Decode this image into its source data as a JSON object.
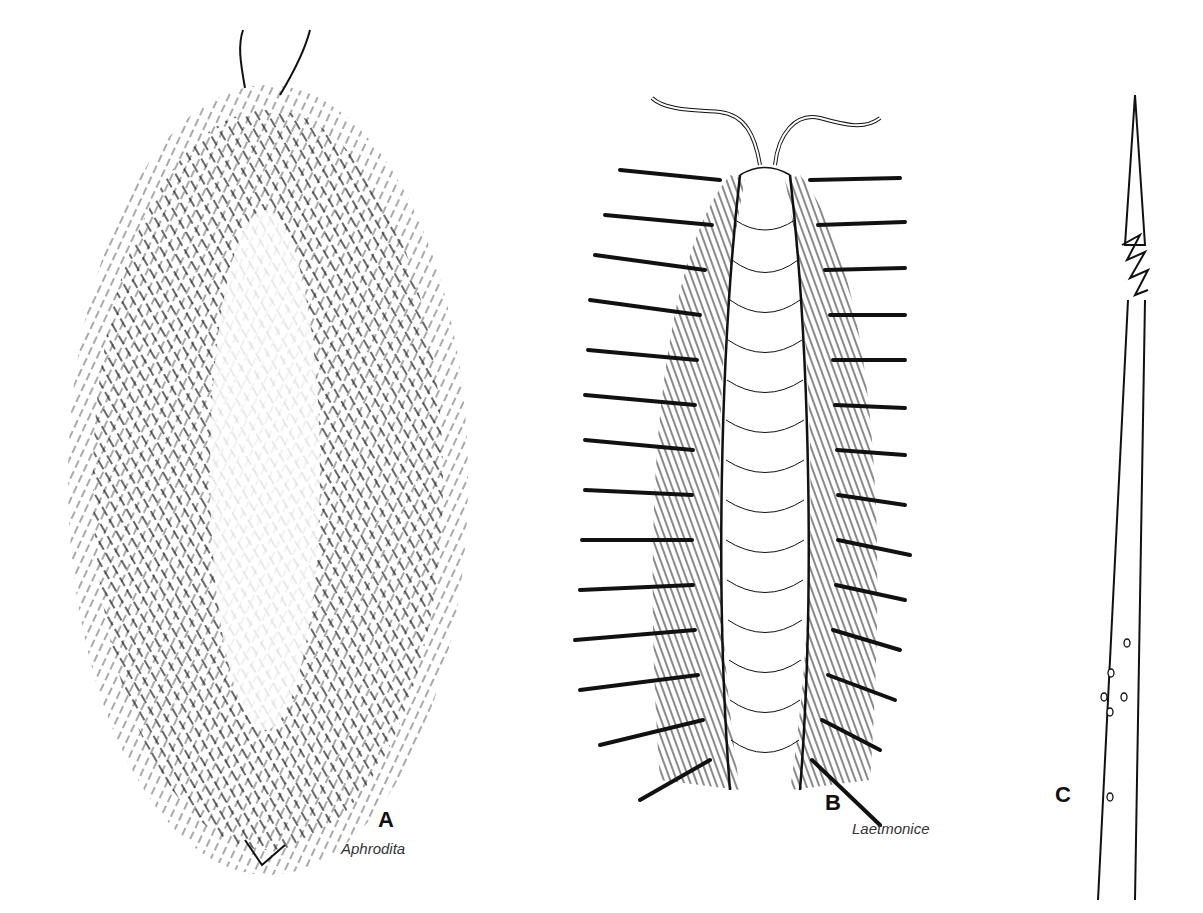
{
  "figure": {
    "panels": [
      {
        "letter": "A",
        "caption": "Aphrodita"
      },
      {
        "letter": "B",
        "caption": "Laetmonice"
      },
      {
        "letter": "C",
        "caption": ""
      }
    ]
  },
  "colors": {
    "ink": "#111111",
    "background": "#ffffff",
    "caption": "#333333"
  }
}
